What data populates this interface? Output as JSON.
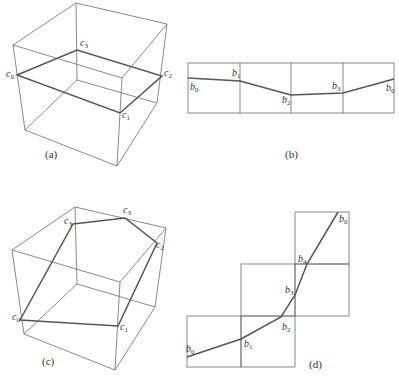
{
  "panels": [
    {
      "id": "a",
      "caption": "(a)",
      "labels": [
        {
          "text": "c",
          "sub": "0",
          "x": 6,
          "y": 77
        },
        {
          "text": "c",
          "sub": "1",
          "x": 122,
          "y": 118
        },
        {
          "text": "c",
          "sub": "2",
          "x": 164,
          "y": 76
        },
        {
          "text": "c",
          "sub": "3",
          "x": 80,
          "y": 46
        }
      ]
    },
    {
      "id": "b",
      "caption": "(b)",
      "labels": [
        {
          "text": "b",
          "sub": "0",
          "x": 190,
          "y": 90
        },
        {
          "text": "b",
          "sub": "1",
          "x": 232,
          "y": 76
        },
        {
          "text": "b",
          "sub": "2",
          "x": 282,
          "y": 103
        },
        {
          "text": "b",
          "sub": "3",
          "x": 332,
          "y": 89
        },
        {
          "text": "b",
          "sub": "0",
          "x": 386,
          "y": 91
        }
      ]
    },
    {
      "id": "c",
      "caption": "(c)",
      "labels": [
        {
          "text": "c",
          "sub": "0",
          "x": 12,
          "y": 320
        },
        {
          "text": "c",
          "sub": "1",
          "x": 120,
          "y": 330
        },
        {
          "text": "c",
          "sub": "2",
          "x": 156,
          "y": 248
        },
        {
          "text": "c",
          "sub": "3",
          "x": 64,
          "y": 224
        },
        {
          "text": "c",
          "sub": "3",
          "x": 123,
          "y": 213
        }
      ]
    },
    {
      "id": "d",
      "caption": "(d)",
      "labels": [
        {
          "text": "b",
          "sub": "0",
          "x": 186,
          "y": 352
        },
        {
          "text": "b",
          "sub": "1",
          "x": 244,
          "y": 347
        },
        {
          "text": "b",
          "sub": "2",
          "x": 282,
          "y": 330
        },
        {
          "text": "b",
          "sub": "3",
          "x": 285,
          "y": 293
        },
        {
          "text": "b",
          "sub": "4",
          "x": 298,
          "y": 262
        },
        {
          "text": "b",
          "sub": "0",
          "x": 339,
          "y": 222
        }
      ]
    }
  ]
}
